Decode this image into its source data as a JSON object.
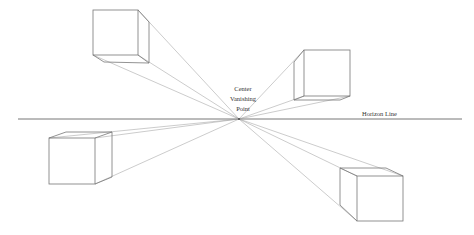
{
  "diagram": {
    "labels": {
      "vanishing_point": [
        "Center",
        "Vanishing",
        "Point"
      ],
      "horizon": "Horizon Line"
    },
    "vanishing_point": {
      "x": 239,
      "y": 119
    },
    "horizon": {
      "x1": 18,
      "x2": 462,
      "y": 119
    },
    "cubes": [
      {
        "name": "top-left",
        "front": [
          [
            93,
            10
          ],
          [
            138,
            10
          ],
          [
            138,
            55
          ],
          [
            93,
            55
          ]
        ],
        "back": [
          [
            104,
            22
          ],
          [
            149,
            22
          ],
          [
            149,
            63
          ],
          [
            104,
            63
          ]
        ]
      },
      {
        "name": "top-right",
        "front": [
          [
            304,
            50
          ],
          [
            350,
            50
          ],
          [
            350,
            96
          ],
          [
            304,
            96
          ]
        ],
        "back": [
          [
            294,
            62
          ],
          [
            340,
            62
          ],
          [
            340,
            100
          ],
          [
            294,
            100
          ]
        ]
      },
      {
        "name": "bottom-left",
        "front": [
          [
            49,
            138
          ],
          [
            95,
            138
          ],
          [
            95,
            184
          ],
          [
            49,
            184
          ]
        ],
        "back": [
          [
            66,
            132
          ],
          [
            112,
            132
          ],
          [
            112,
            177
          ],
          [
            66,
            177
          ]
        ]
      },
      {
        "name": "bottom-right",
        "front": [
          [
            357,
            176
          ],
          [
            403,
            176
          ],
          [
            403,
            221
          ],
          [
            357,
            221
          ]
        ],
        "back": [
          [
            340,
            168
          ],
          [
            386,
            168
          ],
          [
            386,
            205
          ],
          [
            340,
            205
          ]
        ]
      }
    ],
    "colors": {
      "line": "#777777",
      "ray": "#999999",
      "text": "#333333",
      "background": "#ffffff"
    }
  }
}
